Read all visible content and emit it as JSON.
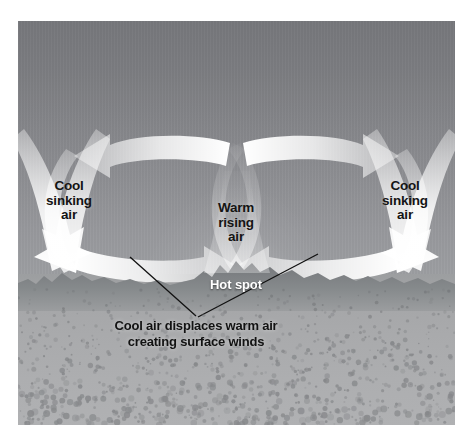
{
  "figure": {
    "kind": "convection-cell-diagram",
    "title_visible": false,
    "background": "#ffffff"
  },
  "palette": {
    "sky_top": "#76777b",
    "sky_bottom": "#9ea0a3",
    "ground_top": "#9c9ea0",
    "ground_bottom": "#b0b1b3",
    "terrain": "#7c7e82",
    "arrow_fill": "#ffffff",
    "label_text": "#141414",
    "hotspot_text": "#ffffff",
    "leader_line": "#111111"
  },
  "labels": {
    "cool_left": "Cool\nsinking\nair",
    "cool_right": "Cool\nsinking\nair",
    "warm_rising": "Warm\nrising\nair",
    "hot_spot": "Hot spot",
    "caption": "Cool air displaces warm air\ncreating surface winds"
  },
  "icons": {
    "arrow_top_left": "arrow-left-icon",
    "arrow_top_right": "arrow-right-icon",
    "arrow_bottom_left_cell": "arrow-right-icon",
    "arrow_bottom_right_cell": "arrow-left-icon",
    "arrow_sink_left": "arrow-down-left-icon",
    "arrow_sink_right": "arrow-down-right-icon"
  },
  "annotations": {
    "leader_left_from": "caption",
    "leader_left_to": "left surface wind arrow",
    "leader_right_from": "caption",
    "leader_right_to": "right surface wind arrow"
  }
}
